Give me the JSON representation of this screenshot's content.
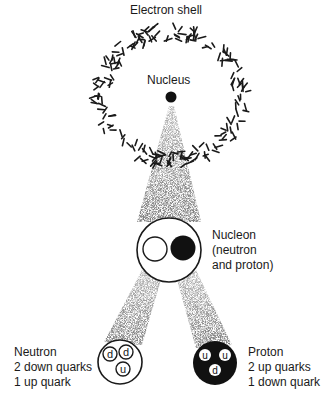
{
  "title": "Electron shell",
  "labels": {
    "electron_shell": "Electron shell",
    "nucleus": "Nucleus",
    "nucleon": [
      "Nucleon",
      "(neutron",
      "and proton)"
    ],
    "neutron": [
      "Neutron",
      "2 down quarks",
      "1 up quark"
    ],
    "proton": [
      "Proton",
      "2 up quarks",
      "1 down quark"
    ]
  },
  "quarks": {
    "neutron": [
      "d",
      "d",
      "u"
    ],
    "proton": [
      "u",
      "u",
      "d"
    ]
  },
  "colors": {
    "ink": "#1a1a1a",
    "background": "#ffffff",
    "stipple": "#555555"
  }
}
